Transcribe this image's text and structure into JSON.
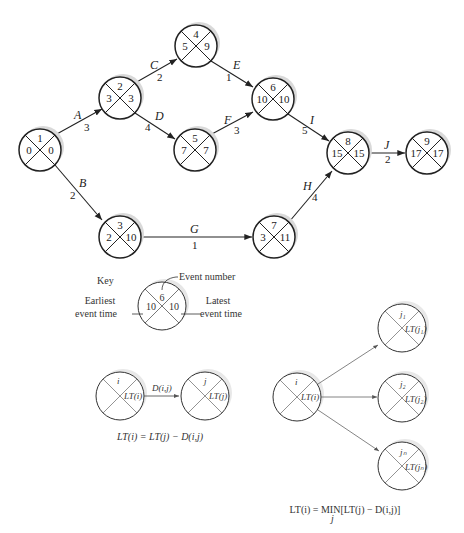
{
  "network": {
    "nodes": [
      {
        "id": "1",
        "event": "1",
        "earliest": "0",
        "latest": "0",
        "cx": 40,
        "cy": 150
      },
      {
        "id": "2",
        "event": "2",
        "earliest": "3",
        "latest": "3",
        "cx": 120,
        "cy": 98
      },
      {
        "id": "3",
        "event": "3",
        "earliest": "2",
        "latest": "10",
        "cx": 120,
        "cy": 237
      },
      {
        "id": "4",
        "event": "4",
        "earliest": "5",
        "latest": "9",
        "cx": 196,
        "cy": 46
      },
      {
        "id": "5",
        "event": "5",
        "earliest": "7",
        "latest": "7",
        "cx": 195,
        "cy": 150
      },
      {
        "id": "6",
        "event": "6",
        "earliest": "10",
        "latest": "10",
        "cx": 273,
        "cy": 99
      },
      {
        "id": "7",
        "event": "7",
        "earliest": "3",
        "latest": "11",
        "cx": 274,
        "cy": 237
      },
      {
        "id": "8",
        "event": "8",
        "earliest": "15",
        "latest": "15",
        "cx": 348,
        "cy": 153
      },
      {
        "id": "9",
        "event": "9",
        "earliest": "17",
        "latest": "17",
        "cx": 427,
        "cy": 153
      }
    ],
    "activities": [
      {
        "name": "A",
        "duration": "3",
        "from": "1",
        "to": "2"
      },
      {
        "name": "B",
        "duration": "2",
        "from": "1",
        "to": "3"
      },
      {
        "name": "C",
        "duration": "2",
        "from": "2",
        "to": "4"
      },
      {
        "name": "D",
        "duration": "4",
        "from": "2",
        "to": "5"
      },
      {
        "name": "E",
        "duration": "1",
        "from": "4",
        "to": "6"
      },
      {
        "name": "F",
        "duration": "3",
        "from": "5",
        "to": "6"
      },
      {
        "name": "G",
        "duration": "1",
        "from": "3",
        "to": "7"
      },
      {
        "name": "H",
        "duration": "4",
        "from": "7",
        "to": "8"
      },
      {
        "name": "I",
        "duration": "5",
        "from": "6",
        "to": "8"
      },
      {
        "name": "J",
        "duration": "2",
        "from": "8",
        "to": "9"
      }
    ]
  },
  "key": {
    "title": "Key",
    "event_number_label": "Event number",
    "earliest_label_line1": "Earliest",
    "earliest_label_line2": "event time",
    "latest_label_line1": "Latest",
    "latest_label_line2": "event time",
    "sample_event": "6",
    "sample_earliest": "10",
    "sample_latest": "10"
  },
  "rule_single": {
    "node_i": "i",
    "node_i_value": "LT(i)",
    "node_j": "j",
    "node_j_value": "LT(j)",
    "edge_label": "D(i,j)",
    "formula": "LT(i) = LT(j) − D(i,j)"
  },
  "rule_multi": {
    "node_i": "i",
    "node_i_value": "LT(i)",
    "successors": [
      {
        "label": "j₁",
        "value": "LT(j₁)"
      },
      {
        "label": "j₂",
        "value": "LT(j₂)"
      },
      {
        "label": "jₙ",
        "value": "LT(jₙ)"
      }
    ],
    "formula": "LT(i) = MIN[LT(j) − D(i,j)]",
    "formula_subscript": "j"
  }
}
